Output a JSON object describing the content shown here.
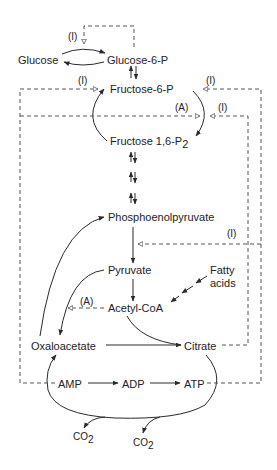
{
  "diagram": {
    "type": "metabolic-pathway",
    "colors": {
      "line": "#2a2a2a",
      "dashed": "#555555",
      "text": "#222222",
      "background": "#ffffff"
    },
    "metabolites": {
      "glucose": "Glucose",
      "glucose6p": "Glucose-6-P",
      "fructose6p": "Fructose-6-P",
      "fructose16p2": "Fructose 1,6-P",
      "fructose16p2_sub": "2",
      "pep": "Phosphoenolpyruvate",
      "pyruvate": "Pyruvate",
      "fatty_acids_line1": "Fatty",
      "fatty_acids_line2": "acids",
      "acetylcoa": "Acetyl-CoA",
      "oxaloacetate": "Oxaloacetate",
      "citrate": "Citrate",
      "amp": "AMP",
      "adp": "ADP",
      "atp": "ATP",
      "co2_a": "CO",
      "co2_a_sub": "2",
      "co2_b": "CO",
      "co2_b_sub": "2"
    },
    "regulation_labels": {
      "hexokinase_inhibition": "(I)",
      "pfk_inhibition_left": "(I)",
      "pfk_inhibition_right_top": "(I)",
      "fbpase_activation": "(A)",
      "fbpase_inhibition_right": "(I)",
      "pyruvate_kinase_inhibition": "(I)",
      "pyruvate_carboxylase_activation": "(A)"
    },
    "legend": {
      "I": "Inhibition",
      "A": "Activation"
    }
  }
}
